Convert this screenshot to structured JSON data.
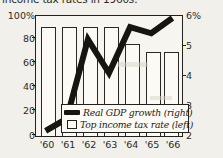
{
  "caption": "income tax rates in 1960s.",
  "chart_data": {
    "type": "bar",
    "title": "income tax rates in 1960s.",
    "xlabel": "",
    "ylabel": "",
    "categories": [
      "'60",
      "'61",
      "'62",
      "'63",
      "'64",
      "'65",
      "'66"
    ],
    "grid": false,
    "legend_position": "inside-bottom-center",
    "series": [
      {
        "name": "Top income tax rate (left)",
        "type": "bar",
        "axis": "left",
        "unit": "%",
        "values": [
          91,
          91,
          91,
          91,
          77,
          70,
          70
        ],
        "color": "#fbfaf5",
        "edge_color": "#2b2926"
      },
      {
        "name": "Real GDP growth (right)",
        "type": "line",
        "axis": "right",
        "unit": "%",
        "values": [
          2.2,
          2.6,
          5.2,
          4.1,
          5.6,
          5.4,
          6.0
        ],
        "color": "#17150f"
      }
    ],
    "axis_left": {
      "label": "",
      "ticks": [
        "0",
        "20",
        "40",
        "60",
        "80",
        "100%"
      ],
      "values": [
        0,
        20,
        40,
        60,
        80,
        100
      ],
      "ylim": [
        0,
        100
      ]
    },
    "axis_right": {
      "label": "",
      "ticks": [
        "2",
        "3",
        "4",
        "5",
        "6%"
      ],
      "values": [
        2,
        3,
        4,
        5,
        6
      ],
      "ylim": [
        2,
        6
      ]
    }
  },
  "legend": {
    "items": [
      {
        "label": "Real GDP growth (right)",
        "swatch": "line-swatch"
      },
      {
        "label": "Top income tax rate (left)",
        "swatch": "box-swatch"
      }
    ]
  }
}
